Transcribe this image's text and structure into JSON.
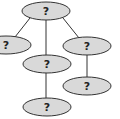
{
  "diagram": {
    "type": "tree",
    "nodes": [
      {
        "id": "root",
        "label": "?",
        "cx": 46,
        "cy": 11
      },
      {
        "id": "left",
        "label": "?",
        "cx": 5,
        "cy": 45
      },
      {
        "id": "middle",
        "label": "?",
        "cx": 46,
        "cy": 64
      },
      {
        "id": "right",
        "label": "?",
        "cx": 87,
        "cy": 46
      },
      {
        "id": "right-child",
        "label": "?",
        "cx": 87,
        "cy": 86
      },
      {
        "id": "bottom",
        "label": "?",
        "cx": 46,
        "cy": 107
      }
    ],
    "edges": [
      {
        "from": "root",
        "to": "left"
      },
      {
        "from": "root",
        "to": "middle"
      },
      {
        "from": "root",
        "to": "right"
      },
      {
        "from": "right",
        "to": "right-child"
      },
      {
        "from": "middle",
        "to": "bottom"
      }
    ]
  }
}
